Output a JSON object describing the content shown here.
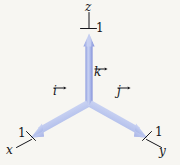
{
  "figure": {
    "kind": "3d-coordinate-axes-with-unit-vectors",
    "background_color": "#f7f6f2",
    "vector_color": "#8d9ce0",
    "vector_highlight_color": "#c9d2f2",
    "ink_color": "#15151a",
    "axes": [
      {
        "id": "z",
        "label": "z",
        "tick_label": "1",
        "direction": "up"
      },
      {
        "id": "x",
        "label": "x",
        "tick_label": "1",
        "direction": "down-left"
      },
      {
        "id": "y",
        "label": "y",
        "tick_label": "1",
        "direction": "down-right"
      }
    ],
    "unit_vectors": [
      {
        "id": "k",
        "label": "k",
        "axis": "z"
      },
      {
        "id": "i",
        "label": "i",
        "axis": "x"
      },
      {
        "id": "j",
        "label": "j",
        "axis": "y"
      }
    ],
    "origin": {
      "x": 89,
      "y": 104
    }
  },
  "labels": {
    "z_axis": "z",
    "x_axis": "x",
    "y_axis": "y",
    "z_tick": "1",
    "x_tick": "1",
    "y_tick": "1",
    "vector_k": "k",
    "vector_i": "i",
    "vector_j": "j"
  }
}
